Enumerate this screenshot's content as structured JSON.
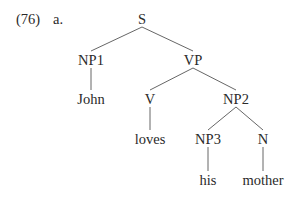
{
  "example": {
    "number": "(76)",
    "sub": "a."
  },
  "tree": {
    "nodes": [
      {
        "id": "S",
        "label": "S"
      },
      {
        "id": "NP1",
        "label": "NP1"
      },
      {
        "id": "VP",
        "label": "VP"
      },
      {
        "id": "John",
        "label": "John"
      },
      {
        "id": "V",
        "label": "V"
      },
      {
        "id": "NP2",
        "label": "NP2"
      },
      {
        "id": "loves",
        "label": "loves"
      },
      {
        "id": "NP3",
        "label": "NP3"
      },
      {
        "id": "N",
        "label": "N"
      },
      {
        "id": "his",
        "label": "his"
      },
      {
        "id": "mother",
        "label": "mother"
      }
    ],
    "edges": [
      [
        "S",
        "NP1"
      ],
      [
        "S",
        "VP"
      ],
      [
        "NP1",
        "John"
      ],
      [
        "VP",
        "V"
      ],
      [
        "VP",
        "NP2"
      ],
      [
        "V",
        "loves"
      ],
      [
        "NP2",
        "NP3"
      ],
      [
        "NP2",
        "N"
      ],
      [
        "NP3",
        "his"
      ],
      [
        "N",
        "mother"
      ]
    ]
  }
}
